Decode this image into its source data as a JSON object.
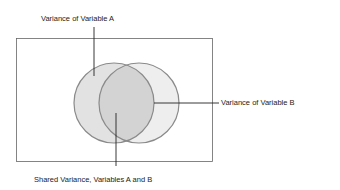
{
  "diagram": {
    "type": "venn",
    "labels": {
      "a": "Variance of Variable A",
      "b": "Variance of Variable B",
      "shared": "Shared Variance, Variables A and B"
    },
    "colors": {
      "circle_fill_a": "#e2e2e2",
      "circle_fill_b": "#ececec",
      "overlap_fill": "#d4d4d4",
      "circle_stroke": "#8a8a8a",
      "frame_stroke": "#666666",
      "leader_line": "#222222"
    }
  }
}
